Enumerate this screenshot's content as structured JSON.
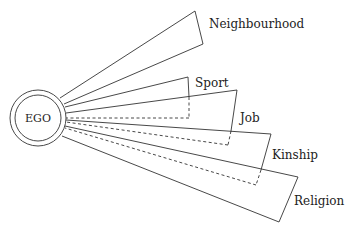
{
  "diagram": {
    "center": {
      "label": "EGO"
    },
    "sectors": [
      {
        "label": "Neighbourhood"
      },
      {
        "label": "Sport"
      },
      {
        "label": "Job"
      },
      {
        "label": "Kinship"
      },
      {
        "label": "Religion"
      }
    ]
  }
}
